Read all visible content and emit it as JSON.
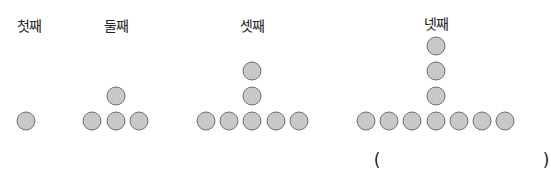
{
  "stages": [
    {
      "label": "첫째",
      "label_x": 29,
      "dots": [
        [
          26,
          121
        ]
      ]
    },
    {
      "label": "둘째",
      "label_x": 116,
      "dots": [
        [
          92,
          121
        ],
        [
          116,
          121
        ],
        [
          139,
          121
        ],
        [
          116,
          96
        ]
      ]
    },
    {
      "label": "셋째",
      "label_x": 252,
      "dots": [
        [
          206,
          121
        ],
        [
          229,
          121
        ],
        [
          252,
          121
        ],
        [
          276,
          121
        ],
        [
          299,
          121
        ],
        [
          252,
          96
        ],
        [
          252,
          71
        ]
      ]
    },
    {
      "label": "넷째",
      "label_x": 436,
      "dots": [
        [
          366,
          121
        ],
        [
          389,
          121
        ],
        [
          412,
          121
        ],
        [
          436,
          121
        ],
        [
          459,
          121
        ],
        [
          482,
          121
        ],
        [
          505,
          121
        ],
        [
          436,
          96
        ],
        [
          436,
          71
        ],
        [
          436,
          46
        ]
      ]
    }
  ],
  "answer": {
    "open": "(",
    "close": ")",
    "value": ""
  },
  "colors": {
    "dot_fill": "#c8c8c8",
    "dot_stroke": "#6e6e6e"
  }
}
